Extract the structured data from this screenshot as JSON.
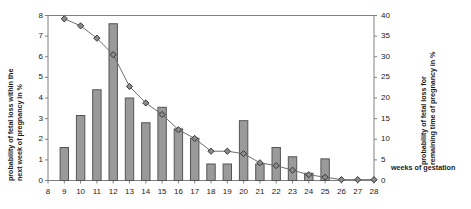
{
  "chart_data": {
    "type": "bar",
    "title": "",
    "xlabel": "weeks of gestation",
    "ylabel": "probability of fetal loss within the next week of pregnancy in %",
    "y2label": "probability of fetal loss for remaining time of pregnancy in %",
    "categories": [
      8,
      9,
      10,
      11,
      12,
      13,
      14,
      15,
      16,
      17,
      18,
      19,
      20,
      21,
      22,
      23,
      24,
      25,
      26,
      27,
      28
    ],
    "xlim": [
      8,
      28
    ],
    "ylim": [
      0,
      8
    ],
    "y2lim": [
      0,
      40
    ],
    "yticks": [
      0,
      1,
      2,
      3,
      4,
      5,
      6,
      7,
      8
    ],
    "y2ticks": [
      0,
      5,
      10,
      15,
      20,
      25,
      30,
      35,
      40
    ],
    "grid": false,
    "legend": "none",
    "series": [
      {
        "name": "probability of fetal loss within the next week of pregnancy in %",
        "type": "bar",
        "axis": "left",
        "values": [
          0,
          1.6,
          3.15,
          4.4,
          7.6,
          4.0,
          2.8,
          3.55,
          2.5,
          2.05,
          0.8,
          0.8,
          2.9,
          0.8,
          1.6,
          1.15,
          0.35,
          1.05,
          0,
          0,
          0
        ]
      },
      {
        "name": "probability of fetal loss for remaining time of pregnancy in %",
        "type": "line",
        "axis": "right",
        "marker": "diamond",
        "values": [
          null,
          39.2,
          37.5,
          34.5,
          30.5,
          22.8,
          18.8,
          16.0,
          12.3,
          10.2,
          7.1,
          7.1,
          6.5,
          4.3,
          3.6,
          2.5,
          1.4,
          0.8,
          0.2,
          0.2,
          0.2
        ]
      }
    ],
    "colors": {
      "bar_fill": "#9a9a9a",
      "bar_edge": "#555555",
      "line": "#6e6e6e",
      "marker_fill": "#8a8a8a",
      "marker_edge": "#3a3a3a",
      "axis": "#808080",
      "text": "#1a1a1a"
    }
  },
  "axes": {
    "left_title_line1": "probability of fetal loss within the",
    "left_title_line2": "next week of pregnancy in %",
    "right_title_line1": "probability of fetal loss for",
    "right_title_line2": "remaining time of pregnancy in %",
    "x_title": "weeks of gestation"
  }
}
